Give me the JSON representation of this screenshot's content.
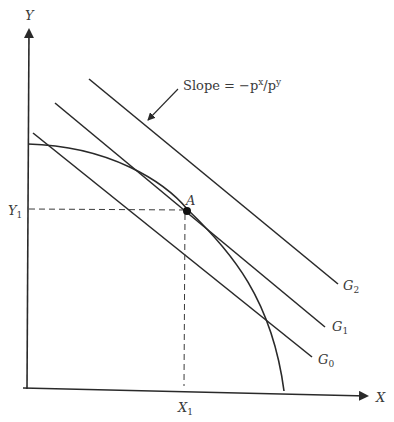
{
  "diagram": {
    "axes": {
      "y_label": "Y",
      "x_label": "X",
      "y_tick_label": "Y",
      "y_tick_sub": "1",
      "x_tick_label": "X",
      "x_tick_sub": "1"
    },
    "point": {
      "label": "A"
    },
    "annotation": {
      "text_prefix": "Slope = −p",
      "sup1": "x",
      "mid": "/p",
      "sup2": "y"
    },
    "lines": [
      {
        "name": "G",
        "sub": "0"
      },
      {
        "name": "G",
        "sub": "1"
      },
      {
        "name": "G",
        "sub": "2"
      }
    ],
    "colors": {
      "line": "#2a2a2a",
      "text": "#3a3a3a",
      "background": "#ffffff"
    }
  }
}
